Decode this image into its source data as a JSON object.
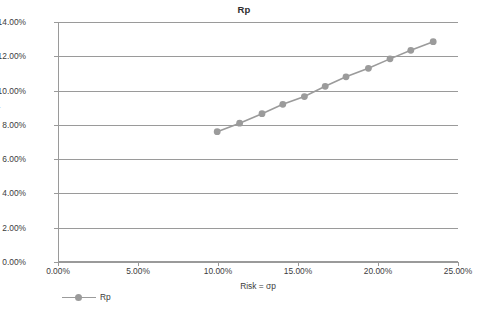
{
  "chart_data": {
    "type": "line",
    "title": "Rp",
    "xlabel": "Risk = σp",
    "ylabel": "Return Rp",
    "xlim": [
      0,
      25
    ],
    "ylim": [
      0,
      14
    ],
    "grid": true,
    "legend_position": "bottom-left",
    "x_tick_labels": [
      "0.00%",
      "5.00%",
      "10.00%",
      "15.00%",
      "20.00%",
      "25.00%"
    ],
    "x_tick_values": [
      0,
      5,
      10,
      15,
      20,
      25
    ],
    "y_tick_labels": [
      "0.00%",
      "2.00%",
      "4.00%",
      "6.00%",
      "8.00%",
      "10.00%",
      "12.00%",
      "14.00%"
    ],
    "y_tick_values": [
      0,
      2,
      4,
      6,
      8,
      10,
      12,
      14
    ],
    "series": [
      {
        "name": "Rp",
        "color": "#9b9b9b",
        "marker": "circle",
        "x": [
          9.95,
          11.35,
          12.75,
          14.05,
          15.4,
          16.7,
          18.0,
          19.4,
          20.75,
          22.05,
          23.45
        ],
        "values": [
          7.6,
          8.1,
          8.65,
          9.2,
          9.65,
          10.25,
          10.8,
          11.3,
          11.85,
          12.35,
          12.85
        ]
      }
    ]
  },
  "legend": {
    "entries": [
      {
        "label": "Rp"
      }
    ]
  },
  "colors": {
    "series": "#9b9b9b",
    "gridline": "#9a9a9a",
    "text": "#3c3c3c",
    "background": "#ffffff"
  }
}
